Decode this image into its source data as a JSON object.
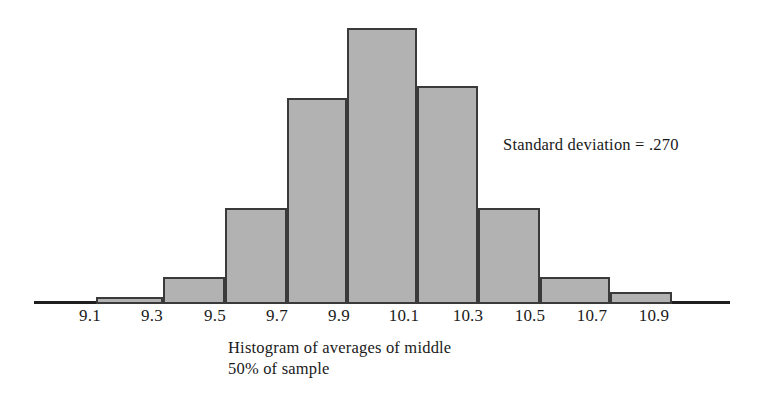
{
  "chart_data": {
    "type": "bar",
    "title": "",
    "subtitle": "",
    "caption_lines": [
      "Histogram of averages of middle",
      "50% of sample"
    ],
    "annotation": "Standard deviation  =  .270",
    "annotation_label": "Standard deviation",
    "annotation_value": ".270",
    "xlabel": "",
    "ylabel": "",
    "grid": false,
    "legend": "none",
    "bin_width": 0.2,
    "xlim": [
      8.95,
      11.15
    ],
    "ylim": [
      0,
      1.0
    ],
    "tick_labels": [
      "9.1",
      "9.3",
      "9.5",
      "9.7",
      "9.9",
      "10.1",
      "10.3",
      "10.5",
      "10.7",
      "10.9"
    ],
    "categories": [
      "9.0-9.2",
      "9.2-9.4",
      "9.4-9.6",
      "9.6-9.8",
      "9.8-10.0",
      "10.0-10.2",
      "10.2-10.4",
      "10.4-10.6",
      "10.6-10.8",
      "10.8-11.0"
    ],
    "bin_centers": [
      9.1,
      9.3,
      9.5,
      9.7,
      9.9,
      10.1,
      10.3,
      10.5,
      10.7,
      10.9
    ],
    "values": [
      0.015,
      0.088,
      0.341,
      0.744,
      1.0,
      0.788,
      0.341,
      0.088,
      0.033,
      0.0
    ],
    "bars": [
      {
        "label": "9.1",
        "value": 0.015,
        "x": 96,
        "width": 67,
        "top": 297,
        "height": 7
      },
      {
        "label": "9.3",
        "value": 0.088,
        "x": 163,
        "width": 62,
        "top": 277,
        "height": 27
      },
      {
        "label": "9.5",
        "value": 0.341,
        "x": 225,
        "width": 62,
        "top": 208,
        "height": 96
      },
      {
        "label": "9.7",
        "value": 0.744,
        "x": 287,
        "width": 60,
        "top": 98,
        "height": 206
      },
      {
        "label": "9.9",
        "value": 1.0,
        "x": 347,
        "width": 70,
        "top": 28,
        "height": 276
      },
      {
        "label": "10.1",
        "value": 0.788,
        "x": 417,
        "width": 61,
        "top": 86,
        "height": 218
      },
      {
        "label": "10.3",
        "value": 0.341,
        "x": 478,
        "width": 62,
        "top": 208,
        "height": 96
      },
      {
        "label": "10.5",
        "value": 0.088,
        "x": 540,
        "width": 70,
        "top": 277,
        "height": 27
      },
      {
        "label": "10.7",
        "value": 0.033,
        "x": 610,
        "width": 62,
        "top": 292,
        "height": 12
      }
    ],
    "tick_positions": [
      {
        "label": "9.1",
        "x": 90
      },
      {
        "label": "9.3",
        "x": 152
      },
      {
        "label": "9.5",
        "x": 215
      },
      {
        "label": "9.7",
        "x": 277
      },
      {
        "label": "9.9",
        "x": 339
      },
      {
        "label": "10.1",
        "x": 404
      },
      {
        "label": "10.3",
        "x": 468
      },
      {
        "label": "10.5",
        "x": 530
      },
      {
        "label": "10.7",
        "x": 592
      },
      {
        "label": "10.9",
        "x": 654
      }
    ],
    "axis": {
      "x": 34,
      "y": 301,
      "width": 696
    },
    "colors": {
      "bar_fill": "#b2b2b2",
      "bar_stroke": "#3a3a3a",
      "axis": "#1f1f1f",
      "text": "#1a1a1a",
      "background": "#ffffff"
    }
  }
}
